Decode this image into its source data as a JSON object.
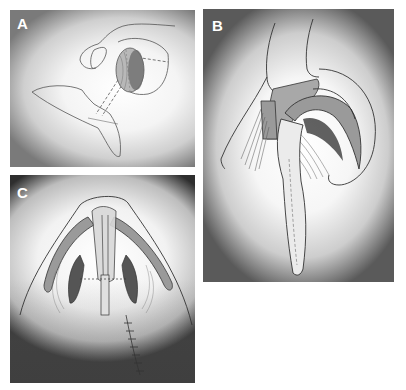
{
  "figure": {
    "panels": [
      {
        "id": "A",
        "label": "A",
        "description": "Lateral view: dashed strut/graft passing from nasal base to lobule with shaded cartilage dome"
      },
      {
        "id": "B",
        "label": "B",
        "description": "Oblique view: stippled graft between medial crura, curved lateral crura with long columellar strut extending downward"
      },
      {
        "id": "C",
        "label": "C",
        "description": "Basal view: nasal tip with alar cartilages, shaded lateral crura, central columellar strut and vertical sutured incision line"
      }
    ],
    "colors": {
      "line": "#333333",
      "cartilage_fill": "#9a9a9a",
      "dark_shading": "#555555",
      "label_text": "#ffffff"
    }
  }
}
